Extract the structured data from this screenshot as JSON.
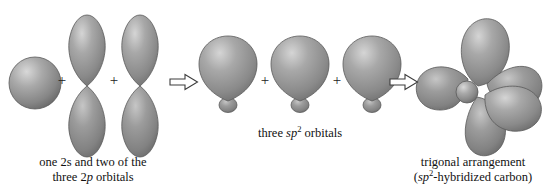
{
  "figure": {
    "background_color": "#ffffff",
    "orbital_fill": "#8e8e8e",
    "orbital_highlight": "#cfcfcf",
    "orbital_shadow": "#5a5a5a",
    "outline_color": "#4a4a4a",
    "text_color": "#111111"
  },
  "groups": {
    "left": {
      "caption_line1": "one 2s and two of the",
      "caption_line2_pre": "three  2",
      "caption_line2_italic": "p",
      "caption_line2_post": " orbitals",
      "operators": [
        "+",
        "+"
      ],
      "orbitals": [
        {
          "name": "2s-orbital",
          "type": "s",
          "label": "2s"
        },
        {
          "name": "2p-orbital-1",
          "type": "p",
          "label": "2p"
        },
        {
          "name": "2p-orbital-2",
          "type": "p",
          "label": "2p"
        }
      ]
    },
    "middle": {
      "caption_pre": "three ",
      "caption_italic": "sp",
      "caption_sup": "2",
      "caption_post": " orbitals",
      "operators": [
        "+",
        "+"
      ],
      "orbitals": [
        {
          "name": "sp2-orbital-1",
          "type": "sp2",
          "label": "sp2"
        },
        {
          "name": "sp2-orbital-2",
          "type": "sp2",
          "label": "sp2"
        },
        {
          "name": "sp2-orbital-3",
          "type": "sp2",
          "label": "sp2"
        }
      ]
    },
    "right": {
      "caption_line1": "trigonal arrangement",
      "caption_line2_open": "(",
      "caption_line2_italic": "sp",
      "caption_line2_sup": "2",
      "caption_line2_post": "-hybridized carbon)",
      "orbitals": [
        {
          "name": "trigonal-lobe-up",
          "type": "sp2-lobe"
        },
        {
          "name": "trigonal-lobe-left",
          "type": "sp2-lobe"
        },
        {
          "name": "trigonal-lobe-right-upper",
          "type": "sp2-lobe"
        },
        {
          "name": "trigonal-lobe-right-lower",
          "type": "sp2-lobe"
        },
        {
          "name": "trigonal-lobe-down",
          "type": "sp2-lobe"
        },
        {
          "name": "trigonal-core-sphere",
          "type": "core"
        }
      ]
    }
  },
  "arrows": [
    {
      "name": "hybridization-arrow-1",
      "glyph": "⇒"
    },
    {
      "name": "hybridization-arrow-2",
      "glyph": "⇒"
    }
  ]
}
